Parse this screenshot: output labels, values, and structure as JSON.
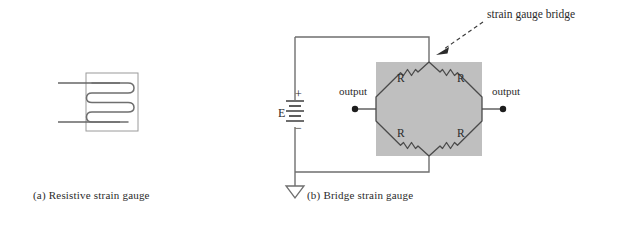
{
  "figure": {
    "kind": "technical-diagram",
    "background_color": "#ffffff",
    "line_color": "#555555",
    "text_color": "#2b2b2b",
    "shade_color": "#bfbfbf"
  },
  "panel_a": {
    "caption": "(a) Resistive strain gauge",
    "gauge_name": "resistive-strain-gauge",
    "carrier_label": "carrier rectangle",
    "grid_traces": 4,
    "lead_count": 2
  },
  "panel_b": {
    "caption": "(b) Bridge strain gauge",
    "callout_label": "strain gauge bridge",
    "source_label": "E",
    "polarity_plus": "+",
    "polarity_minus": "−",
    "output_left_label": "output",
    "output_right_label": "output",
    "resistors": [
      {
        "position": "top-left",
        "label": "R"
      },
      {
        "position": "top-right",
        "label": "R"
      },
      {
        "position": "bottom-left",
        "label": "R"
      },
      {
        "position": "bottom-right",
        "label": "R"
      }
    ],
    "ground_symbol": "triangle-ground",
    "battery_cells": 3
  }
}
